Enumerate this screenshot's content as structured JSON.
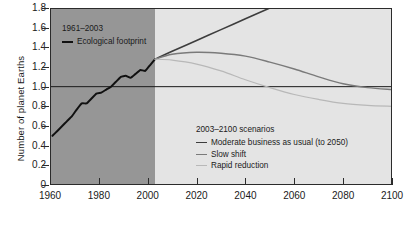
{
  "axes": {
    "ylabel": "Number of planet Earths",
    "yticks": [
      "0",
      "0.2",
      "0.4",
      "0.6",
      "0.8",
      "1.0",
      "1.2",
      "1.4",
      "1.6",
      "1.8"
    ],
    "xticks": [
      "1960",
      "1980",
      "2000",
      "2020",
      "2040",
      "2060",
      "2080",
      "2100"
    ]
  },
  "legend_historical": {
    "title": "1961–2003",
    "items": [
      {
        "label": "Ecological footprint",
        "color": "#111111",
        "width": "2px"
      }
    ]
  },
  "legend_scenarios": {
    "title": "2003–2100 scenarios",
    "items": [
      {
        "label": "Moderate business as usual (to 2050)",
        "color": "#3d3d3d",
        "width": "1.6px"
      },
      {
        "label": "Slow shift",
        "color": "#7a7a7a",
        "width": "1.4px"
      },
      {
        "label": "Rapid reduction",
        "color": "#b8b8b8",
        "width": "1.2px"
      }
    ]
  },
  "colors": {
    "historical_band": "#969696",
    "scenario_band": "#e4e4e4",
    "axis": "#2b2b2b",
    "reference_line": "#1a1a1a"
  },
  "chart_data": {
    "type": "line",
    "title": "",
    "xlabel": "",
    "ylabel": "Number of planet Earths",
    "xlim": [
      1960,
      2100
    ],
    "ylim": [
      0,
      1.8
    ],
    "grid": false,
    "legend_position": "inside",
    "reference_line": {
      "y": 1.0,
      "label": "One planet Earth"
    },
    "shaded_regions": [
      {
        "from": 1960,
        "to": 2003,
        "color": "#969696",
        "label": "1961–2003 historical"
      },
      {
        "from": 2003,
        "to": 2100,
        "color": "#e4e4e4",
        "label": "2003–2100 scenarios"
      }
    ],
    "series": [
      {
        "name": "Ecological footprint",
        "color": "#111111",
        "x": [
          1961,
          1963,
          1965,
          1967,
          1969,
          1971,
          1973,
          1975,
          1977,
          1979,
          1981,
          1983,
          1985,
          1987,
          1989,
          1991,
          1993,
          1995,
          1997,
          1999,
          2001,
          2003
        ],
        "values": [
          0.5,
          0.55,
          0.6,
          0.65,
          0.7,
          0.77,
          0.83,
          0.83,
          0.88,
          0.93,
          0.94,
          0.97,
          1.0,
          1.05,
          1.1,
          1.11,
          1.09,
          1.13,
          1.17,
          1.16,
          1.22,
          1.28
        ]
      },
      {
        "name": "Moderate business as usual (to 2050)",
        "color": "#3d3d3d",
        "x": [
          2003,
          2010,
          2020,
          2030,
          2040,
          2050
        ],
        "values": [
          1.28,
          1.36,
          1.47,
          1.58,
          1.69,
          1.8
        ]
      },
      {
        "name": "Slow shift",
        "color": "#7a7a7a",
        "x": [
          2003,
          2010,
          2020,
          2030,
          2040,
          2050,
          2060,
          2070,
          2080,
          2090,
          2100
        ],
        "values": [
          1.28,
          1.33,
          1.35,
          1.34,
          1.31,
          1.25,
          1.18,
          1.1,
          1.03,
          0.99,
          0.97
        ]
      },
      {
        "name": "Rapid reduction",
        "color": "#b8b8b8",
        "x": [
          2003,
          2010,
          2020,
          2030,
          2040,
          2050,
          2060,
          2070,
          2080,
          2090,
          2100
        ],
        "values": [
          1.28,
          1.27,
          1.23,
          1.16,
          1.07,
          0.99,
          0.92,
          0.87,
          0.83,
          0.81,
          0.8
        ]
      }
    ]
  }
}
